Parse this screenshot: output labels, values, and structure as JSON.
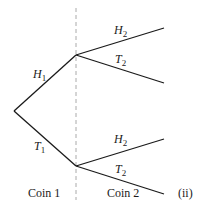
{
  "diagram": {
    "type": "probability-tree",
    "stage_labels": [
      "Coin 1",
      "Coin 2"
    ],
    "figure_tag": "(ii)",
    "branches": {
      "stage1": [
        {
          "label": "H",
          "subscript": "1"
        },
        {
          "label": "T",
          "subscript": "1"
        }
      ],
      "stage2_upper": [
        {
          "label": "H",
          "subscript": "2"
        },
        {
          "label": "T",
          "subscript": "2"
        }
      ],
      "stage2_lower": [
        {
          "label": "H",
          "subscript": "2"
        },
        {
          "label": "T",
          "subscript": "2"
        }
      ]
    },
    "colors": {
      "line": "#1a1a1a",
      "divider": "#aaaaaa"
    }
  }
}
